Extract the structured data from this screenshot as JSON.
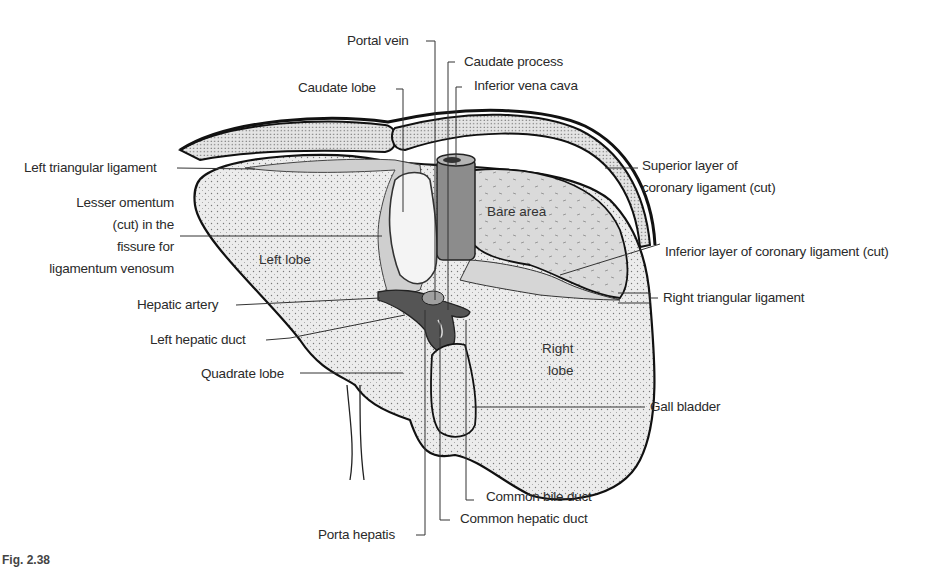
{
  "figure": {
    "caption": "Fig. 2.38"
  },
  "colors": {
    "background": "#ffffff",
    "liver_fill": "#ebebeb",
    "peritoneum_fill": "#d4d4d4",
    "bare_area_fill": "#dadada",
    "ivc_fill": "#8c8c8c",
    "vessel_dark": "#555555",
    "outline": "#111111",
    "leader_line": "#333333",
    "text": "#2a2a2a"
  },
  "labels": {
    "left_side": [
      {
        "id": "left-triangular-ligament",
        "text": "Left triangular ligament"
      },
      {
        "id": "lesser-omentum",
        "lines": [
          "Lesser omentum",
          "(cut) in the",
          "fissure for",
          "ligamentum venosum"
        ]
      },
      {
        "id": "hepatic-artery",
        "text": "Hepatic artery"
      },
      {
        "id": "left-hepatic-duct",
        "text": "Left hepatic duct"
      },
      {
        "id": "quadrate-lobe",
        "text": "Quadrate lobe"
      }
    ],
    "top": [
      {
        "id": "portal-vein",
        "text": "Portal vein"
      },
      {
        "id": "caudate-lobe",
        "text": "Caudate lobe"
      },
      {
        "id": "caudate-process",
        "text": "Caudate process"
      },
      {
        "id": "inferior-vena-cava",
        "text": "Inferior vena cava"
      }
    ],
    "right_side": [
      {
        "id": "superior-layer-coronary",
        "lines": [
          "Superior layer of",
          "coronary ligament (cut)"
        ]
      },
      {
        "id": "inferior-layer-coronary",
        "text": "Inferior layer of coronary ligament (cut)"
      },
      {
        "id": "right-triangular-ligament",
        "text": "Right triangular ligament"
      },
      {
        "id": "gall-bladder",
        "text": "Gall bladder"
      }
    ],
    "bottom": [
      {
        "id": "common-bile-duct",
        "text": "Common bile duct"
      },
      {
        "id": "common-hepatic-duct",
        "text": "Common hepatic duct"
      },
      {
        "id": "porta-hepatis",
        "text": "Porta hepatis"
      }
    ],
    "inside": {
      "left_lobe": "Left lobe",
      "bare_area": "Bare area",
      "right_lobe_line1": "Right",
      "right_lobe_line2": "lobe"
    }
  }
}
